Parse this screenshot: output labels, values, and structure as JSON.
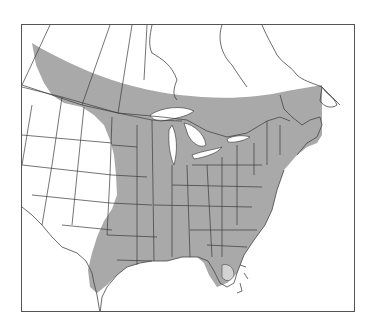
{
  "map": {
    "title": "Species range map",
    "type": "range-map",
    "region": "Eastern North America",
    "legend": [
      {
        "label": "Range",
        "color": "#a9a9a9"
      }
    ],
    "colors": {
      "range_fill": "#a9a9a9",
      "land": "#ffffff",
      "border": "#3a3a3a",
      "frame": "#555555",
      "florida_tip": "#d3d3d3"
    }
  }
}
